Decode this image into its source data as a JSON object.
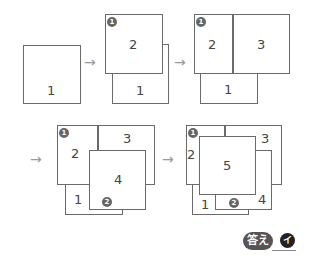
{
  "steps": [
    {
      "id": 1,
      "boxes": [
        {
          "label": "1"
        }
      ]
    },
    {
      "id": 2,
      "boxes": [
        {
          "label": "1"
        },
        {
          "label": "2"
        }
      ],
      "badges": [
        "1"
      ]
    },
    {
      "id": 3,
      "boxes": [
        {
          "label": "1"
        },
        {
          "label": "2"
        },
        {
          "label": "3"
        }
      ],
      "badges": [
        "1"
      ]
    },
    {
      "id": 4,
      "boxes": [
        {
          "label": "1"
        },
        {
          "label": "2"
        },
        {
          "label": "3"
        },
        {
          "label": "4"
        }
      ],
      "badges": [
        "1",
        "2"
      ]
    },
    {
      "id": 5,
      "boxes": [
        {
          "label": "1"
        },
        {
          "label": "2"
        },
        {
          "label": "3"
        },
        {
          "label": "4"
        },
        {
          "label": "5"
        }
      ],
      "badges": [
        "1",
        "2"
      ]
    }
  ],
  "arrow": "→",
  "answer": {
    "label": "答え",
    "value": "イ"
  }
}
